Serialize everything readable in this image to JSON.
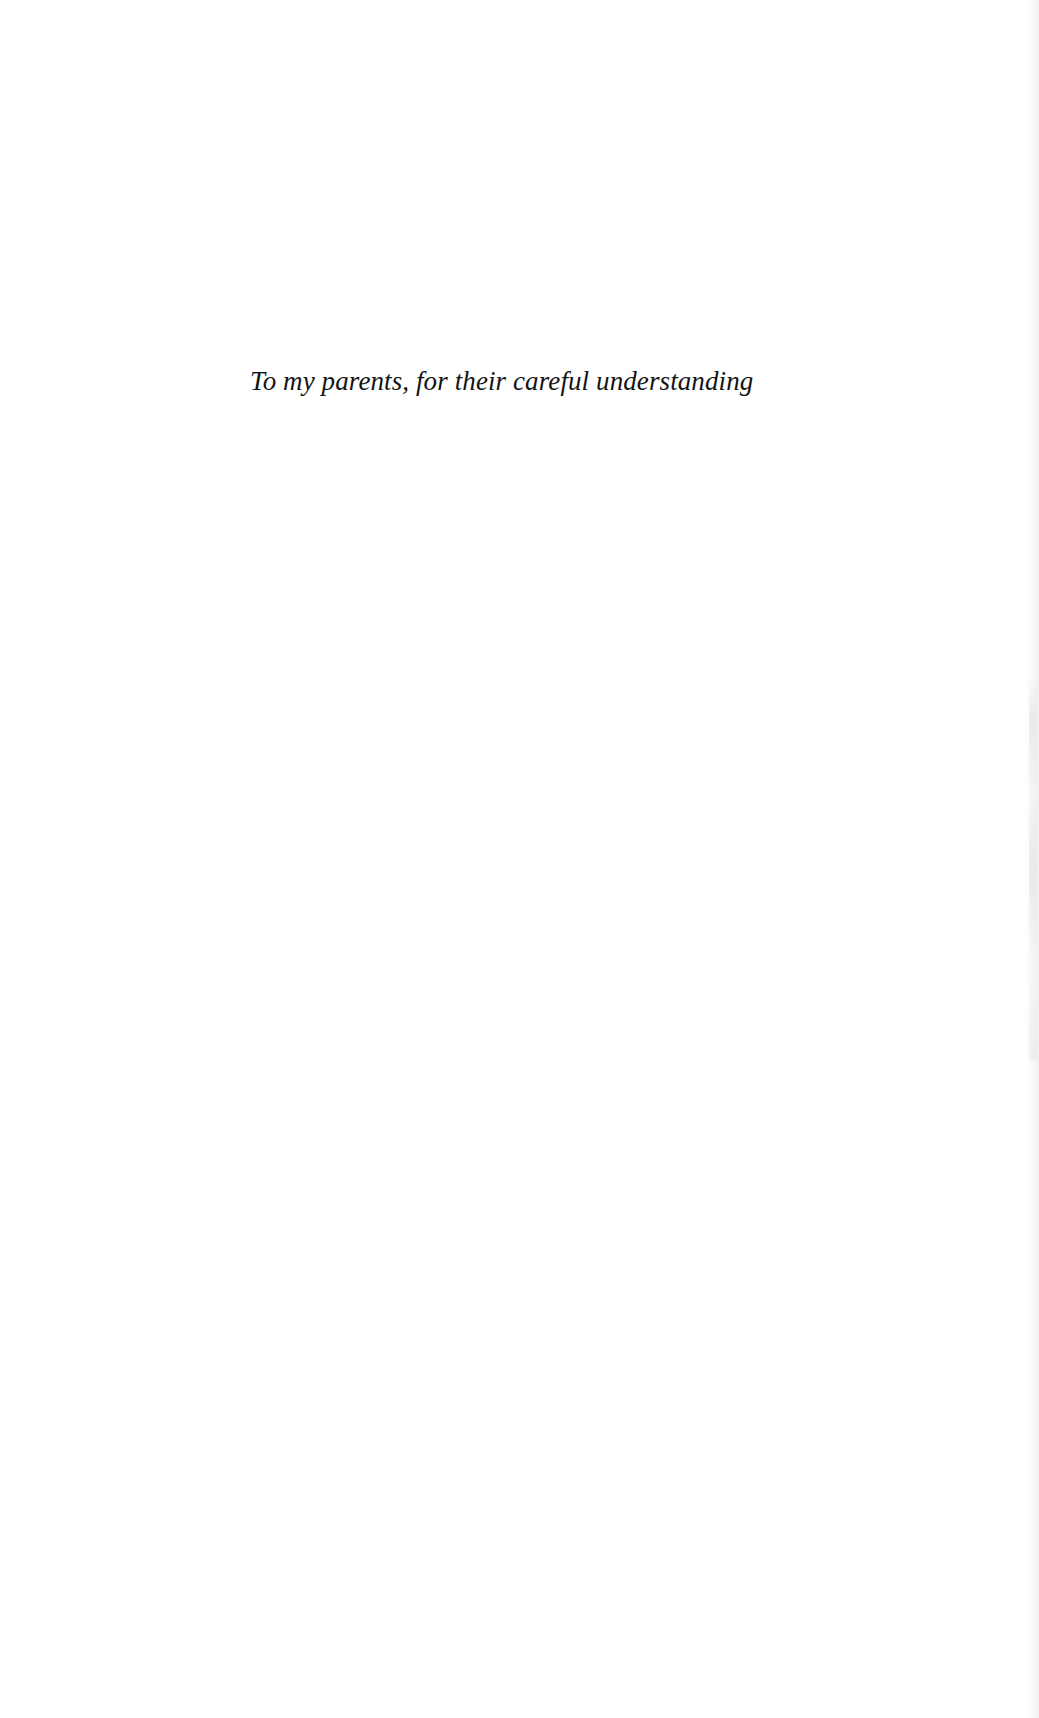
{
  "page": {
    "type": "dedication",
    "background": "#ffffff",
    "text_color": "#141414"
  },
  "dedication": {
    "text": "To my parents, for their careful understanding"
  }
}
